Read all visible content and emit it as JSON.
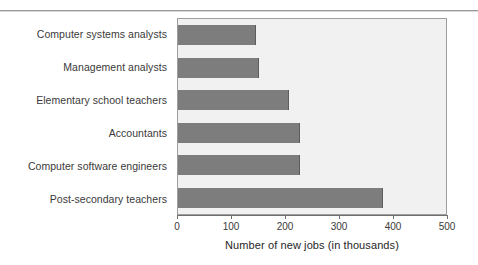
{
  "chart_data": {
    "type": "bar",
    "orientation": "horizontal",
    "title": "",
    "xlabel": "Number of new jobs (in thousands)",
    "ylabel": "",
    "categories": [
      "Computer systems analysts",
      "Management analysts",
      "Elementary school teachers",
      "Accountants",
      "Computer software engineers",
      "Post-secondary teachers"
    ],
    "values": [
      145,
      150,
      205,
      225,
      225,
      380
    ],
    "xlim": [
      0,
      500
    ],
    "xticks": [
      0,
      100,
      200,
      300,
      400,
      500
    ],
    "xtick_labels": [
      "0",
      "100",
      "200",
      "300",
      "400",
      "500"
    ],
    "grid": false,
    "legend": null,
    "colors": {
      "bar": "#7d7d7d",
      "plot_background": "#f1f1f1",
      "plot_border": "#9e9e9e",
      "axis": "#6f6f6f",
      "text": "#3a3a3a",
      "page_background": "#ffffff"
    }
  }
}
